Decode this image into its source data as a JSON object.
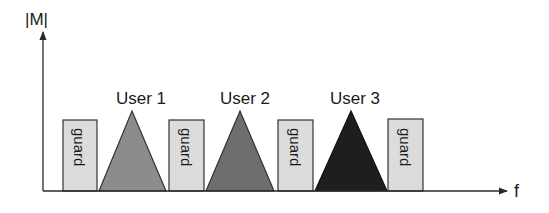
{
  "diagram": {
    "y_axis_label": "|M|",
    "x_axis_label": "f",
    "colors": {
      "axis": "#2a2a2a",
      "guard_fill": "#dcdcdc",
      "guard_stroke": "#333333",
      "user1": "#8c8c8c",
      "user2": "#6e6e6e",
      "user3": "#1e1e1e"
    },
    "guards": [
      {
        "label": "guard"
      },
      {
        "label": "guard"
      },
      {
        "label": "guard"
      },
      {
        "label": "guard"
      }
    ],
    "users": [
      {
        "label": "User 1"
      },
      {
        "label": "User 2"
      },
      {
        "label": "User 3"
      }
    ]
  }
}
